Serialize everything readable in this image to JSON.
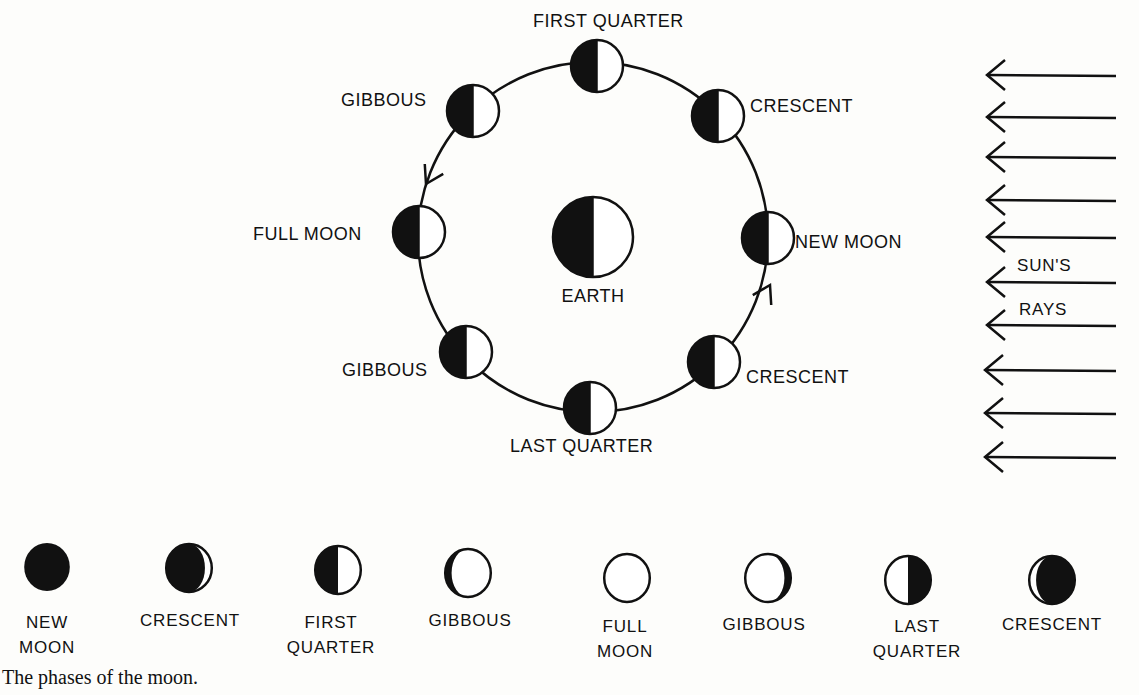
{
  "diagram": {
    "earth": {
      "label": "EARTH",
      "cx": 593,
      "cy": 237,
      "r": 40
    },
    "orbit": {
      "cx": 593,
      "cy": 237,
      "r": 175
    },
    "orbit_moons": [
      {
        "label": "FIRST QUARTER",
        "cx": 597,
        "cy": 66,
        "lx": 533,
        "ly": 27,
        "anchor": "start"
      },
      {
        "label": "CRESCENT",
        "cx": 718,
        "cy": 116,
        "lx": 750,
        "ly": 112,
        "anchor": "start"
      },
      {
        "label": "NEW MOON",
        "cx": 768,
        "cy": 238,
        "lx": 795,
        "ly": 248,
        "anchor": "start"
      },
      {
        "label": "CRESCENT",
        "cx": 714,
        "cy": 362,
        "lx": 746,
        "ly": 383,
        "anchor": "start"
      },
      {
        "label": "LAST QUARTER",
        "cx": 590,
        "cy": 408,
        "lx": 510,
        "ly": 452,
        "anchor": "start"
      },
      {
        "label": "GIBBOUS",
        "cx": 466,
        "cy": 352,
        "lx": 342,
        "ly": 376,
        "anchor": "start"
      },
      {
        "label": "FULL MOON",
        "cx": 419,
        "cy": 232,
        "lx": 253,
        "ly": 240,
        "anchor": "start"
      },
      {
        "label": "GIBBOUS",
        "cx": 473,
        "cy": 111,
        "lx": 341,
        "ly": 106,
        "anchor": "start"
      }
    ],
    "sun_rays": {
      "label_line1": "SUN'S",
      "label_line2": "RAYS",
      "count": 10
    },
    "phase_strip": [
      {
        "label_lines": [
          "NEW",
          "MOON"
        ],
        "shape": "new"
      },
      {
        "label_lines": [
          "CRESCENT"
        ],
        "shape": "waxing-crescent"
      },
      {
        "label_lines": [
          "FIRST",
          "QUARTER"
        ],
        "shape": "first-quarter"
      },
      {
        "label_lines": [
          "GIBBOUS"
        ],
        "shape": "waxing-gibbous"
      },
      {
        "label_lines": [
          "FULL",
          "MOON"
        ],
        "shape": "full"
      },
      {
        "label_lines": [
          "GIBBOUS"
        ],
        "shape": "waning-gibbous"
      },
      {
        "label_lines": [
          "LAST",
          "QUARTER"
        ],
        "shape": "last-quarter"
      },
      {
        "label_lines": [
          "CRESCENT"
        ],
        "shape": "waning-crescent"
      }
    ],
    "caption": "The phases of the moon.",
    "colors": {
      "ink": "#111111",
      "paper": "#fdfdfb"
    }
  }
}
